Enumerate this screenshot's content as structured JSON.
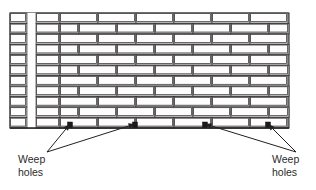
{
  "figure": {
    "background_color": "#ffffff",
    "line_color": "#231f20",
    "brick_face_color": "#fdfdfd",
    "brick_shade_color": "#b4b4b4",
    "mortar_color": "#d9d9d9",
    "text_color": "#2b2b2b"
  },
  "wall": {
    "left": 10,
    "top": 13,
    "right": 289,
    "bottom": 128,
    "course_count": 11,
    "course_height": 10.45,
    "brick_length": 38,
    "bond": "running bond",
    "end_column": {
      "left": 10,
      "right": 27,
      "description": "header / end column of stacked bricks"
    },
    "cavity_gap": {
      "left": 27,
      "right": 36,
      "description": "vertical cavity gap"
    },
    "second_column": {
      "left": 36,
      "right": 60,
      "description": "narrow stacked column"
    }
  },
  "weep_holes": {
    "marker_color": "#1a1a1a",
    "course_y": 122,
    "positions": [
      70,
      135,
      205,
      268
    ]
  },
  "labels": {
    "left": {
      "line1": "Weep",
      "line2": "holes",
      "x": 18,
      "y": 163
    },
    "right": {
      "line1": "Weep",
      "line2": "holes",
      "x": 272,
      "y": 163
    }
  },
  "leaders": {
    "left_origin": {
      "x": 47,
      "y": 152
    },
    "right_origin": {
      "x": 296,
      "y": 152
    },
    "left_targets": [
      {
        "x": 70,
        "y": 124
      },
      {
        "x": 135,
        "y": 124
      }
    ],
    "right_targets": [
      {
        "x": 205,
        "y": 124
      },
      {
        "x": 268,
        "y": 124
      }
    ]
  }
}
